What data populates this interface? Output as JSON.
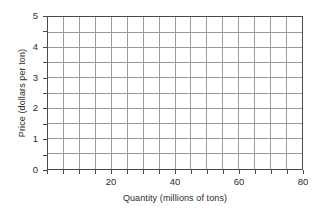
{
  "chart_data": {
    "type": "line",
    "title": "",
    "subtitle": "",
    "xlabel": "Quantity (millions of tons)",
    "ylabel": "Price (dollars per ton)",
    "xlim": [
      0,
      80
    ],
    "ylim": [
      0,
      5
    ],
    "x_major_tick_interval": 5,
    "y_major_tick_interval": 0.5,
    "x_tick_values": [
      0,
      5,
      10,
      15,
      20,
      25,
      30,
      35,
      40,
      45,
      50,
      55,
      60,
      65,
      70,
      75,
      80
    ],
    "y_tick_values": [
      0,
      0.5,
      1,
      1.5,
      2,
      2.5,
      3,
      3.5,
      4,
      4.5,
      5
    ],
    "x_tick_labels": [
      "20",
      "40",
      "60",
      "80"
    ],
    "x_tick_label_values": [
      20,
      40,
      60,
      80
    ],
    "y_tick_labels": [
      "0",
      "1",
      "2",
      "3",
      "4",
      "5"
    ],
    "y_tick_label_values": [
      0,
      1,
      2,
      3,
      4,
      5
    ],
    "grid": true,
    "grid_color": "#9a9a9a",
    "axis_color": "#4a4a4a",
    "background_color": "#ffffff",
    "legend": "none",
    "series": [],
    "annotations": []
  },
  "axes": {
    "x_title": "Quantity (millions of tons)",
    "y_title": "Price (dollars per ton)"
  }
}
